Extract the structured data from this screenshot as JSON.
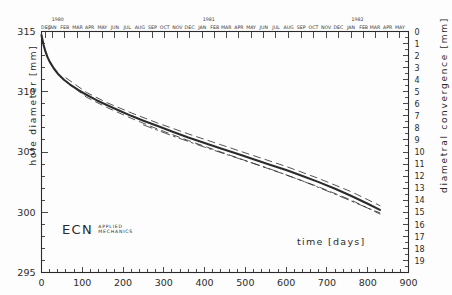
{
  "figure": {
    "background_color": "#fdfdfd",
    "ink_color": "#2b2b2b",
    "logo": {
      "name": "ECN",
      "line1": "APPLIED",
      "line2": "MECHANICS"
    },
    "xlabel": "time [days]",
    "ylabel_left": "hole diameter [mm]",
    "ylabel_right": "diametral convergence [mm]"
  },
  "chart_data": {
    "type": "line",
    "title": "",
    "subtitle": "",
    "xlabel": "time [days]",
    "ylabel": "hole diameter [mm]",
    "ylabel_secondary": "diametral convergence [mm]",
    "grid": false,
    "legend": null,
    "xlim": [
      0,
      900
    ],
    "ylim": [
      295,
      315
    ],
    "ylim_secondary": [
      0,
      20
    ],
    "xticks": [
      0,
      100,
      200,
      300,
      400,
      500,
      600,
      700,
      800,
      900
    ],
    "xtick_labels": [
      "0",
      "100",
      "200",
      "300",
      "400",
      "500",
      "600",
      "700",
      "800",
      "900"
    ],
    "xtick_minor_step": 20,
    "yticks_left": [
      295,
      300,
      305,
      310,
      315
    ],
    "ytick_labels_left": [
      "295",
      "300",
      "305",
      "310",
      "315"
    ],
    "ytick_minor_step": 1,
    "yticks_right": [
      0,
      1,
      2,
      3,
      4,
      5,
      6,
      7,
      8,
      9,
      10,
      11,
      12,
      13,
      14,
      15,
      16,
      17,
      18,
      19
    ],
    "ytick_labels_right": [
      "0",
      "1",
      "2",
      "3",
      "4",
      "5",
      "6",
      "7",
      "8",
      "9",
      "10",
      "11",
      "12",
      "13",
      "14",
      "15",
      "16",
      "17",
      "18",
      "19"
    ],
    "secondary_axis_note": "convergence = 315 - diameter",
    "top_axis": {
      "years": [
        {
          "label": "1980",
          "x_day": 40
        },
        {
          "label": "1981",
          "x_day": 410
        },
        {
          "label": "1982",
          "x_day": 775
        }
      ],
      "months": [
        {
          "label": "DEC",
          "x_day": 11
        },
        {
          "label": "JAN",
          "x_day": 27
        },
        {
          "label": "FEB",
          "x_day": 57
        },
        {
          "label": "MAR",
          "x_day": 88
        },
        {
          "label": "APR",
          "x_day": 118
        },
        {
          "label": "MAY",
          "x_day": 149
        },
        {
          "label": "JUN",
          "x_day": 180
        },
        {
          "label": "JUL",
          "x_day": 210
        },
        {
          "label": "AUG",
          "x_day": 241
        },
        {
          "label": "SEP",
          "x_day": 272
        },
        {
          "label": "OCT",
          "x_day": 302
        },
        {
          "label": "NOV",
          "x_day": 333
        },
        {
          "label": "DEC",
          "x_day": 363
        },
        {
          "label": "JAN",
          "x_day": 394
        },
        {
          "label": "FEB",
          "x_day": 425
        },
        {
          "label": "MAR",
          "x_day": 453
        },
        {
          "label": "APR",
          "x_day": 484
        },
        {
          "label": "MAY",
          "x_day": 514
        },
        {
          "label": "JUN",
          "x_day": 545
        },
        {
          "label": "JUL",
          "x_day": 575
        },
        {
          "label": "AUG",
          "x_day": 606
        },
        {
          "label": "SEP",
          "x_day": 637
        },
        {
          "label": "OCT",
          "x_day": 667
        },
        {
          "label": "NOV",
          "x_day": 698
        },
        {
          "label": "DEC",
          "x_day": 728
        },
        {
          "label": "JAN",
          "x_day": 759
        },
        {
          "label": "FEB",
          "x_day": 790
        },
        {
          "label": "MAR",
          "x_day": 818
        },
        {
          "label": "APR",
          "x_day": 849
        },
        {
          "label": "MAY",
          "x_day": 879
        }
      ]
    },
    "series": [
      {
        "name": "mean hole diameter",
        "style": "solid-thick",
        "x": [
          0,
          5,
          10,
          15,
          20,
          30,
          40,
          55,
          70,
          90,
          110,
          135,
          160,
          190,
          220,
          250,
          285,
          320,
          360,
          400,
          440,
          480,
          520,
          560,
          600,
          640,
          680,
          720,
          760,
          800,
          830
        ],
        "y": [
          314.7,
          313.9,
          313.3,
          312.85,
          312.5,
          311.95,
          311.5,
          311.0,
          310.6,
          310.15,
          309.75,
          309.3,
          308.9,
          308.45,
          308.0,
          307.6,
          307.15,
          306.7,
          306.2,
          305.75,
          305.3,
          304.85,
          304.4,
          303.95,
          303.5,
          303.0,
          302.5,
          301.95,
          301.35,
          300.7,
          300.2
        ]
      },
      {
        "name": "upper envelope",
        "style": "dashed-thin",
        "x": [
          60,
          110,
          160,
          220,
          285,
          360,
          440,
          520,
          600,
          680,
          760,
          830
        ],
        "y": [
          311.15,
          309.95,
          309.1,
          308.25,
          307.4,
          306.5,
          305.6,
          304.7,
          303.8,
          302.8,
          301.7,
          300.55
        ]
      },
      {
        "name": "lower envelope",
        "style": "dashed-thin",
        "x": [
          60,
          110,
          160,
          220,
          285,
          360,
          440,
          520,
          600,
          680,
          760,
          830
        ],
        "y": [
          310.85,
          309.55,
          308.7,
          307.8,
          306.9,
          305.95,
          305.0,
          304.05,
          303.1,
          302.1,
          301.0,
          299.85
        ]
      },
      {
        "name": "auxiliary trace",
        "style": "dashdot-thin",
        "x": [
          250,
          320,
          400,
          480,
          560,
          640,
          720,
          800,
          830
        ],
        "y": [
          307.25,
          306.35,
          305.4,
          304.5,
          303.6,
          302.6,
          301.5,
          300.35,
          299.95
        ]
      }
    ]
  }
}
